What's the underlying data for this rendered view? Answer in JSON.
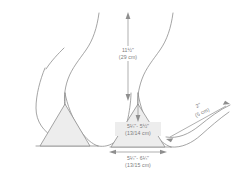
{
  "diagram": {
    "background_color": "#ffffff",
    "line_color": "#8e8e8e",
    "fill_color": "#ededed",
    "text_color": "#7b7b7b"
  },
  "dimensions": {
    "vertical_top": {
      "label_line_1": "11½\"",
      "label_line_2": "(29 cm)",
      "orientation": "vertical",
      "arrow_ends": "both"
    },
    "triangle_height": {
      "label_line_1": "5¼\"- 5½\"",
      "label_line_2": "(13/14 cm)",
      "orientation": "vertical",
      "arrow_ends": "down"
    },
    "triangle_base": {
      "label_line_1": "5¼\"- 6¼\"",
      "label_line_2": "(13/15 cm)",
      "orientation": "horizontal",
      "arrow_ends": "both"
    },
    "side_leader": {
      "label_line_1": "2\"",
      "label_line_2": "(5 cm)",
      "orientation": "diagonal",
      "arrow_ends": "both"
    }
  },
  "shapes": {
    "left_triangle": {
      "name": "left-cup-triangle",
      "filled": true
    },
    "right_triangle": {
      "name": "right-cup-triangle",
      "filled": true
    },
    "contours": {
      "count": 4,
      "name": "body-contour-curves"
    },
    "baseline": {
      "name": "band-baseline"
    }
  }
}
